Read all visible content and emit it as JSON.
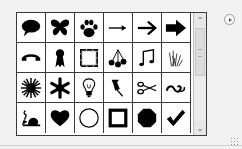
{
  "panel": {
    "title": "Custom Shape Picker",
    "menu_button_icon": "play-right-icon"
  },
  "shapes": [
    {
      "name": "speech-bubble-icon",
      "label": "Talk 1"
    },
    {
      "name": "butterfly-icon",
      "label": "Butterfly"
    },
    {
      "name": "paw-print-icon",
      "label": "Paw Print"
    },
    {
      "name": "thin-arrow-right-icon",
      "label": "Arrow 1"
    },
    {
      "name": "arrow-right-icon",
      "label": "Arrow 2"
    },
    {
      "name": "bold-arrow-right-icon",
      "label": "Arrow 3"
    },
    {
      "name": "telephone-handset-icon",
      "label": "Phone"
    },
    {
      "name": "ribbon-award-icon",
      "label": "Ribbon"
    },
    {
      "name": "rough-frame-icon",
      "label": "Frame"
    },
    {
      "name": "cherries-icon",
      "label": "Cherries"
    },
    {
      "name": "music-notes-icon",
      "label": "Eighth Notes"
    },
    {
      "name": "grass-icon",
      "label": "Grass"
    },
    {
      "name": "starburst-icon",
      "label": "Sun"
    },
    {
      "name": "snowflake-icon",
      "label": "Snowflake"
    },
    {
      "name": "light-bulb-icon",
      "label": "Light Bulb"
    },
    {
      "name": "thumbtack-icon",
      "label": "Tack"
    },
    {
      "name": "scissors-icon",
      "label": "Scissors"
    },
    {
      "name": "ornament-swirl-icon",
      "label": "Ornament"
    },
    {
      "name": "snail-icon",
      "label": "Snail"
    },
    {
      "name": "heart-icon",
      "label": "Heart"
    },
    {
      "name": "circle-outline-icon",
      "label": "Circle Frame"
    },
    {
      "name": "square-frame-icon",
      "label": "Square Frame"
    },
    {
      "name": "octagon-icon",
      "label": "Octagon"
    },
    {
      "name": "checkmark-icon",
      "label": "Checkmark"
    }
  ],
  "scrollbar": {
    "up_icon": "chevron-up-icon",
    "down_icon": "chevron-down-icon",
    "up_glyph": "⌃",
    "down_glyph": "⌄"
  },
  "colors": {
    "shape_fill": "#000000",
    "grid_line": "#3a3a3a",
    "panel_bg": "#f2f2f2"
  }
}
